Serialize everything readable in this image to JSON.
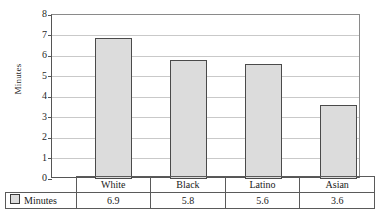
{
  "chart_data": {
    "type": "bar",
    "title": "",
    "xlabel": "",
    "ylabel": "Minutes",
    "categories": [
      "White",
      "Black",
      "Latino",
      "Asian"
    ],
    "values": [
      6.9,
      5.8,
      5.6,
      3.6
    ],
    "series": [
      {
        "name": "Minutes",
        "values": [
          6.9,
          5.8,
          5.6,
          3.6
        ]
      }
    ],
    "ylim": [
      0,
      8
    ],
    "yticks": [
      0,
      1,
      2,
      3,
      4,
      5,
      6,
      7,
      8
    ],
    "ytick_labels": [
      "0",
      "1",
      "2",
      "3",
      "4",
      "5",
      "6",
      "7",
      "8"
    ],
    "grid": true,
    "legend_position": "bottom-table",
    "bar_fill_color": "#dcdcdc",
    "bar_edge_color": "#4a4a4a",
    "gridline_color": "#c9c9c9",
    "axis_color": "#555555"
  },
  "table": {
    "legend_label": "Minutes",
    "legend_swatch_name": "legend-swatch-minutes",
    "header_row": [
      "White",
      "Black",
      "Latino",
      "Asian"
    ],
    "value_row": [
      "6.9",
      "5.8",
      "5.6",
      "3.6"
    ]
  }
}
